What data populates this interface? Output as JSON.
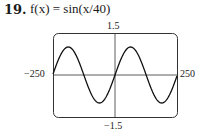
{
  "problem": {
    "number": "19.",
    "title": "f(x) = sin(x/40)"
  },
  "chart_data": {
    "type": "line",
    "title": "f(x) = sin(x/40)",
    "function": "sin(x/40)",
    "xlim": [
      -250,
      250
    ],
    "ylim": [
      -1.5,
      1.5
    ],
    "tick_labels": {
      "x_min": "−250",
      "x_max": "250",
      "y_max": "1.5",
      "y_min": "−1.5"
    },
    "grid": false,
    "series": [
      {
        "name": "sin(x/40)",
        "x": [
          -250,
          -188.5,
          -125.7,
          -62.8,
          0,
          62.8,
          125.7,
          188.5,
          250
        ],
        "values": [
          0.06,
          1,
          0,
          -1,
          0,
          1,
          0,
          -1,
          -0.06
        ]
      }
    ]
  }
}
